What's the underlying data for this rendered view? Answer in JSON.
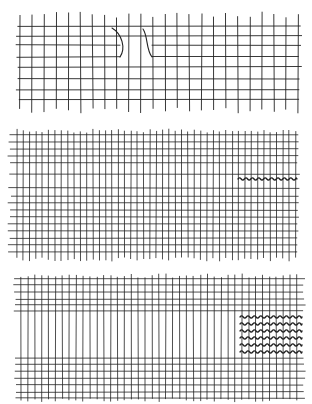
{
  "diagram": {
    "description": "Three hand-drawn woven fabric grids illustrating fabric damage",
    "stroke_color": "#222222",
    "background": "#ffffff",
    "panels": [
      {
        "id": "panel-tear",
        "label": "Grid with slit/tear",
        "bbox": [
          18,
          15,
          298,
          112
        ],
        "verticals": {
          "start_x": 20,
          "count": 24,
          "spacing": 12.1,
          "y1": 15,
          "y2": 110
        },
        "horizontals": [
          26,
          36,
          45,
          57,
          67,
          79,
          90,
          100
        ],
        "horizontal_x": [
          10,
          300
        ],
        "tear": {
          "left_curve": [
            [
              112,
              28
            ],
            [
              122,
              34
            ],
            [
              126,
              48
            ],
            [
              120,
              57
            ]
          ],
          "right_curve": [
            [
              143,
              29
            ],
            [
              148,
              36
            ],
            [
              146,
              50
            ],
            [
              152,
              57
            ]
          ],
          "gap_row_y": 57,
          "gap_x": [
            120,
            152
          ]
        }
      },
      {
        "id": "panel-single-wave",
        "label": "Fine grid with one wavy thread",
        "bbox": [
          12,
          130,
          298,
          260
        ],
        "verticals": {
          "start_x": 17,
          "count": 45,
          "spacing": 6.33,
          "y1": 131,
          "y2": 259
        },
        "horizontals": [
          135,
          142,
          149,
          156,
          163,
          174,
          188,
          196,
          203,
          210,
          217,
          224,
          231,
          238,
          245,
          252
        ],
        "horizontal_x": [
          10,
          298
        ],
        "wavy_threads": [
          {
            "y": 179,
            "x1": 238,
            "x2": 297
          }
        ]
      },
      {
        "id": "panel-multi-wave",
        "label": "Grid with missing weft section and wavy thread patch",
        "bbox": [
          15,
          275,
          304,
          402
        ],
        "verticals": {
          "start_x": 21,
          "count": 41,
          "spacing": 6.9,
          "y1": 276,
          "y2": 400
        },
        "horizontals_top": [
          279,
          285,
          292,
          299,
          305,
          311
        ],
        "horizontals_bottom": [
          358,
          364,
          371,
          378,
          385,
          392,
          398
        ],
        "horizontal_x": [
          15,
          304
        ],
        "wavy_threads": [
          {
            "y": 317,
            "x1": 240,
            "x2": 302
          },
          {
            "y": 324,
            "x1": 240,
            "x2": 302
          },
          {
            "y": 331,
            "x1": 240,
            "x2": 302
          },
          {
            "y": 338,
            "x1": 240,
            "x2": 302
          },
          {
            "y": 345,
            "x1": 240,
            "x2": 302
          },
          {
            "y": 352,
            "x1": 240,
            "x2": 302
          }
        ]
      }
    ]
  }
}
